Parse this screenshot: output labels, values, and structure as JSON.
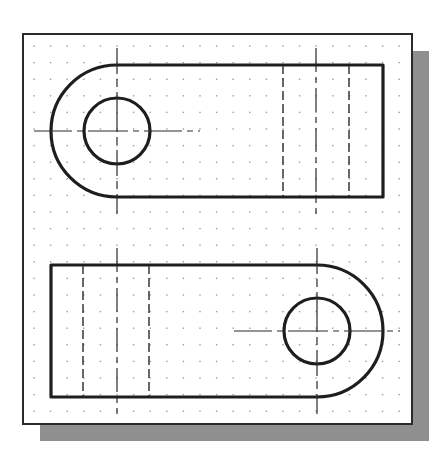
{
  "drawing": {
    "title": "Two part views on a dotted drafting grid",
    "colors": {
      "background": "#ffffff",
      "frame": "#2a2a2a",
      "shadow": "#8f8f8f",
      "object_line": "#1e1e1e",
      "center_line": "#2a2a2a",
      "hidden_line": "#2a2a2a",
      "grid_dot": "#9a9a9a"
    },
    "frame": {
      "x": 23,
      "y": 34,
      "width": 389,
      "height": 390,
      "shadow_offset": 17
    },
    "grid": {
      "spacing": 16.6,
      "origin_x": 34,
      "origin_y": 46
    },
    "views": [
      {
        "name": "top-view",
        "orientation": "rounded-end-left",
        "center": [
          117,
          131
        ],
        "outer_radius": 66,
        "hole_radius": 33,
        "straight_end_x": 383,
        "hidden_lines_x": [
          283,
          349
        ],
        "slot_center_line_x": 316
      },
      {
        "name": "bottom-view",
        "orientation": "rounded-end-right",
        "center": [
          317,
          331
        ],
        "outer_radius": 66,
        "hole_radius": 33,
        "straight_end_x": 51,
        "hidden_lines_x": [
          83,
          149
        ],
        "slot_center_line_x": 117
      }
    ]
  }
}
